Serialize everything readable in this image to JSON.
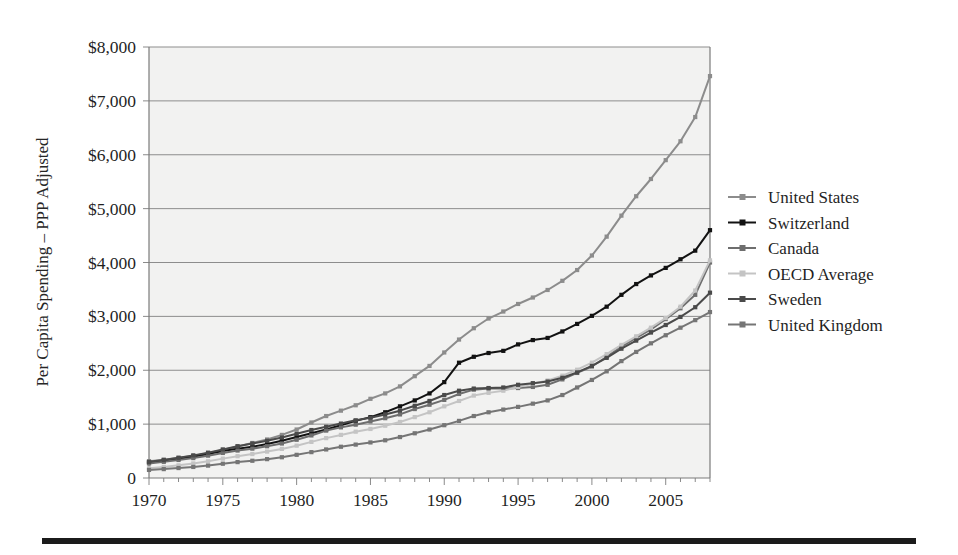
{
  "figure": {
    "background_color": "#ffffff",
    "plot_background_color": "#f2f2f1",
    "bottom_rule_color": "#1b1b1b"
  },
  "chart_data": {
    "type": "line",
    "title": "",
    "xlabel": "",
    "ylabel": "Per Capita Spending – PPP Adjusted",
    "xlim": [
      1970,
      2008
    ],
    "ylim": [
      0,
      8000
    ],
    "grid": true,
    "legend_position": "right",
    "y_tick_labels": [
      "$8,000",
      "$7,000",
      "$6,000",
      "$5,000",
      "$4,000",
      "$3,000",
      "$2,000",
      "$1,000",
      "0"
    ],
    "y_tick_values": [
      8000,
      7000,
      6000,
      5000,
      4000,
      3000,
      2000,
      1000,
      0
    ],
    "x_tick_labels": [
      "1970",
      "1975",
      "1980",
      "1985",
      "1990",
      "1995",
      "2000",
      "2005"
    ],
    "x_tick_values": [
      1970,
      1975,
      1980,
      1985,
      1990,
      1995,
      2000,
      2005
    ],
    "x": [
      1970,
      1971,
      1972,
      1973,
      1974,
      1975,
      1976,
      1977,
      1978,
      1979,
      1980,
      1981,
      1982,
      1983,
      1984,
      1985,
      1986,
      1987,
      1988,
      1989,
      1990,
      1991,
      1992,
      1993,
      1994,
      1995,
      1996,
      1997,
      1998,
      1999,
      2000,
      2001,
      2002,
      2003,
      2004,
      2005,
      2006,
      2007,
      2008
    ],
    "series": [
      {
        "name": "United States",
        "color": "#8c8c8c",
        "values": [
          310,
          340,
          375,
          410,
          460,
          520,
          585,
          650,
          715,
          800,
          900,
          1030,
          1150,
          1250,
          1350,
          1470,
          1570,
          1700,
          1890,
          2080,
          2330,
          2570,
          2780,
          2960,
          3090,
          3230,
          3350,
          3490,
          3660,
          3860,
          4130,
          4480,
          4870,
          5230,
          5550,
          5900,
          6250,
          6700,
          7460
        ]
      },
      {
        "name": "Switzerland",
        "color": "#121212",
        "values": [
          290,
          320,
          355,
          395,
          445,
          500,
          545,
          580,
          630,
          690,
          760,
          830,
          900,
          980,
          1060,
          1130,
          1220,
          1330,
          1440,
          1570,
          1780,
          2140,
          2250,
          2320,
          2360,
          2480,
          2560,
          2600,
          2720,
          2860,
          3010,
          3180,
          3400,
          3600,
          3760,
          3900,
          4060,
          4220,
          4600
        ]
      },
      {
        "name": "Canada",
        "color": "#6e6e6e",
        "values": [
          270,
          300,
          335,
          370,
          415,
          465,
          510,
          545,
          590,
          640,
          710,
          790,
          880,
          940,
          990,
          1050,
          1110,
          1180,
          1280,
          1360,
          1450,
          1560,
          1640,
          1660,
          1660,
          1670,
          1690,
          1730,
          1830,
          1950,
          2070,
          2250,
          2440,
          2600,
          2760,
          2950,
          3150,
          3400,
          4000
        ]
      },
      {
        "name": "OECD Average",
        "color": "#c4c4c4",
        "values": [
          180,
          205,
          235,
          270,
          310,
          360,
          405,
          445,
          490,
          540,
          600,
          670,
          740,
          800,
          860,
          910,
          970,
          1040,
          1130,
          1220,
          1330,
          1430,
          1530,
          1580,
          1620,
          1690,
          1750,
          1810,
          1900,
          2010,
          2140,
          2300,
          2470,
          2630,
          2790,
          2970,
          3180,
          3480,
          4040
        ]
      },
      {
        "name": "Sweden",
        "color": "#4a4a4a",
        "values": [
          300,
          335,
          375,
          420,
          470,
          530,
          590,
          640,
          690,
          750,
          820,
          890,
          950,
          1010,
          1070,
          1120,
          1180,
          1250,
          1340,
          1430,
          1540,
          1620,
          1660,
          1670,
          1680,
          1730,
          1760,
          1790,
          1860,
          1960,
          2080,
          2230,
          2400,
          2550,
          2700,
          2840,
          2990,
          3170,
          3440
        ]
      },
      {
        "name": "United Kingdom",
        "color": "#757575",
        "values": [
          150,
          165,
          185,
          205,
          230,
          265,
          295,
          320,
          350,
          385,
          430,
          480,
          530,
          580,
          620,
          660,
          700,
          760,
          830,
          900,
          980,
          1060,
          1150,
          1220,
          1270,
          1320,
          1380,
          1440,
          1540,
          1680,
          1820,
          1980,
          2170,
          2340,
          2500,
          2650,
          2790,
          2930,
          3080
        ]
      }
    ]
  },
  "legend": {
    "items": [
      {
        "label": "United States"
      },
      {
        "label": "Switzerland"
      },
      {
        "label": "Canada"
      },
      {
        "label": "OECD Average"
      },
      {
        "label": "Sweden"
      },
      {
        "label": "United Kingdom"
      }
    ]
  }
}
